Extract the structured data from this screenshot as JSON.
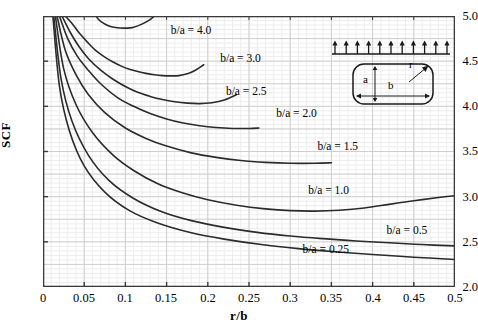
{
  "chart_data": {
    "type": "line",
    "title": "",
    "xlabel": "r/b",
    "ylabel": "SCF",
    "xlim": [
      0,
      0.5
    ],
    "ylim": [
      2.0,
      5.0
    ],
    "xticks": [
      "0",
      "0.05",
      "0.1",
      "0.15",
      "0.2",
      "0.25",
      "0.3",
      "0.35",
      "0.4",
      "0.45",
      "0.5"
    ],
    "xtick_values": [
      0,
      0.05,
      0.1,
      0.15,
      0.2,
      0.25,
      0.3,
      0.35,
      0.4,
      0.45,
      0.5
    ],
    "yticks": [
      "2.0",
      "2.5",
      "3.0",
      "3.5",
      "4.0",
      "4.5",
      "5.0"
    ],
    "ytick_values": [
      2.0,
      2.5,
      3.0,
      3.5,
      4.0,
      4.5,
      5.0
    ],
    "grid": true,
    "grid_minor_x": 0.01,
    "grid_minor_y": 0.05,
    "legend_position": "inline-annotations",
    "series": [
      {
        "name": "b/a = 4.0",
        "label": "b/a = 4.0",
        "label_x": 0.155,
        "label_y": 4.85,
        "x": [
          0.035,
          0.04,
          0.045,
          0.05,
          0.055,
          0.06,
          0.065,
          0.07,
          0.08,
          0.09,
          0.1,
          0.105,
          0.11,
          0.12,
          0.13,
          0.135
        ],
        "y": [
          5.0,
          5.22,
          5.36,
          5.32,
          5.2,
          5.08,
          4.99,
          4.94,
          4.89,
          4.87,
          4.866,
          4.868,
          4.875,
          4.91,
          4.96,
          5.0
        ]
      },
      {
        "name": "b/a = 3.0",
        "label": "b/a = 3.0",
        "label_x": 0.215,
        "label_y": 4.54,
        "x": [
          0.027,
          0.035,
          0.045,
          0.055,
          0.065,
          0.075,
          0.085,
          0.095,
          0.105,
          0.115,
          0.125,
          0.135,
          0.145,
          0.155,
          0.165,
          0.175,
          0.185,
          0.195
        ],
        "y": [
          5.0,
          4.92,
          4.8,
          4.7,
          4.61,
          4.545,
          4.49,
          4.445,
          4.41,
          4.385,
          4.365,
          4.35,
          4.34,
          4.337,
          4.34,
          4.36,
          4.4,
          4.46
        ]
      },
      {
        "name": "b/a = 2.5",
        "label": "b/a = 2.5",
        "label_x": 0.222,
        "label_y": 4.17,
        "x": [
          0.023,
          0.033,
          0.043,
          0.055,
          0.07,
          0.085,
          0.1,
          0.115,
          0.13,
          0.145,
          0.16,
          0.175,
          0.19,
          0.205,
          0.22,
          0.235
        ],
        "y": [
          5.0,
          4.82,
          4.67,
          4.53,
          4.4,
          4.3,
          4.22,
          4.155,
          4.11,
          4.075,
          4.05,
          4.035,
          4.03,
          4.04,
          4.07,
          4.13
        ]
      },
      {
        "name": "b/a = 2.0",
        "label": "b/a = 2.0",
        "label_x": 0.283,
        "label_y": 3.93,
        "x": [
          0.02,
          0.03,
          0.042,
          0.055,
          0.07,
          0.09,
          0.11,
          0.13,
          0.15,
          0.17,
          0.19,
          0.21,
          0.23,
          0.25,
          0.262
        ],
        "y": [
          5.0,
          4.75,
          4.55,
          4.4,
          4.25,
          4.1,
          4.0,
          3.92,
          3.86,
          3.815,
          3.785,
          3.765,
          3.755,
          3.755,
          3.76
        ]
      },
      {
        "name": "b/a = 1.5",
        "label": "b/a = 1.5",
        "label_x": 0.333,
        "label_y": 3.56,
        "x": [
          0.017,
          0.027,
          0.04,
          0.055,
          0.075,
          0.1,
          0.125,
          0.15,
          0.18,
          0.21,
          0.24,
          0.27,
          0.3,
          0.33,
          0.35
        ],
        "y": [
          5.0,
          4.62,
          4.35,
          4.13,
          3.93,
          3.76,
          3.645,
          3.56,
          3.485,
          3.435,
          3.4,
          3.38,
          3.37,
          3.37,
          3.375
        ]
      },
      {
        "name": "b/a = 1.0",
        "label": "b/a = 1.0",
        "label_x": 0.322,
        "label_y": 3.07,
        "x": [
          0.015,
          0.025,
          0.04,
          0.06,
          0.085,
          0.11,
          0.14,
          0.17,
          0.2,
          0.235,
          0.27,
          0.3,
          0.33,
          0.36,
          0.39,
          0.42,
          0.45,
          0.48,
          0.5
        ],
        "y": [
          5.0,
          4.42,
          4.02,
          3.71,
          3.46,
          3.29,
          3.14,
          3.04,
          2.965,
          2.905,
          2.865,
          2.845,
          2.84,
          2.85,
          2.875,
          2.915,
          2.955,
          2.99,
          3.01
        ]
      },
      {
        "name": "b/a = 0.5",
        "label": "b/a = 0.5",
        "label_x": 0.417,
        "label_y": 2.63,
        "x": [
          0.013,
          0.022,
          0.035,
          0.055,
          0.08,
          0.11,
          0.145,
          0.18,
          0.22,
          0.26,
          0.3,
          0.34,
          0.38,
          0.42,
          0.46,
          0.5
        ],
        "y": [
          5.0,
          4.3,
          3.84,
          3.46,
          3.18,
          2.98,
          2.83,
          2.735,
          2.66,
          2.605,
          2.565,
          2.535,
          2.51,
          2.49,
          2.47,
          2.455
        ]
      },
      {
        "name": "b/a = 0.25",
        "label": "b/a = 0.25",
        "label_x": 0.315,
        "label_y": 2.42,
        "x": [
          0.012,
          0.02,
          0.032,
          0.05,
          0.075,
          0.105,
          0.14,
          0.18,
          0.22,
          0.265,
          0.31,
          0.355,
          0.4,
          0.45,
          0.5
        ],
        "y": [
          5.0,
          4.22,
          3.73,
          3.34,
          3.05,
          2.845,
          2.705,
          2.6,
          2.53,
          2.47,
          2.425,
          2.39,
          2.36,
          2.33,
          2.305
        ]
      }
    ]
  },
  "inset": {
    "name": "rounded-rectangle-tension-diagram",
    "dim_a": "a",
    "dim_b": "b",
    "dim_r": "r",
    "arrow_count": 11
  },
  "colors": {
    "curve": "#2b2b2b",
    "axis": "#3a3a3a",
    "grid_major": "#cfcfcf",
    "grid_minor": "#ededed",
    "background": "#ffffff",
    "text": "#000000"
  }
}
